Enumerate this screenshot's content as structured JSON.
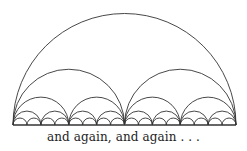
{
  "diagram": {
    "baseline": {
      "x0": 13,
      "x1": 236,
      "y": 125
    },
    "levels": 5,
    "stroke_color": "#333333",
    "stroke_width": 0.9
  },
  "caption": "and again, and again . . ."
}
